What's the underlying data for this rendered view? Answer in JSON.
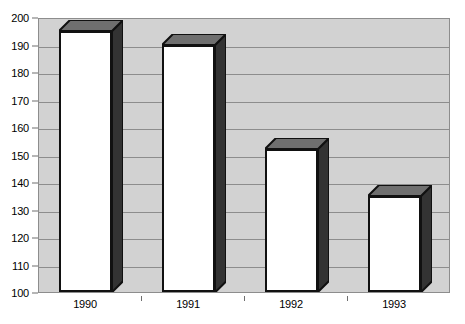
{
  "chart_data": {
    "type": "bar",
    "title": "",
    "subtitle": "",
    "xlabel": "",
    "ylabel": "",
    "categories": [
      "1990",
      "1991",
      "1992",
      "1993"
    ],
    "values": [
      195,
      190,
      152,
      135
    ],
    "series": [
      {
        "name": "",
        "values": [
          195,
          190,
          152,
          135
        ]
      }
    ],
    "ylim": [
      100,
      200
    ],
    "yticks": [
      100,
      110,
      120,
      130,
      140,
      150,
      160,
      170,
      180,
      190,
      200
    ],
    "ytick_labels": [
      "100",
      "110",
      "120",
      "130",
      "140",
      "150",
      "160",
      "170",
      "180",
      "190",
      "200"
    ],
    "grid": true,
    "legend": false,
    "legend_position": "none",
    "style": "3d-column",
    "colors": {
      "bar_front": "#ffffff",
      "bar_side": "#333333",
      "bar_top": "#6f6f6f",
      "bar_outline": "#111111",
      "plot_background": "#d2d2d2",
      "gridline": "#8d8d8d",
      "axis": "#6e6e6e",
      "text": "#000000",
      "page_background": "#ffffff"
    }
  },
  "axes": {
    "y_ticks": [
      {
        "label": "200",
        "value": 200
      },
      {
        "label": "190",
        "value": 190
      },
      {
        "label": "180",
        "value": 180
      },
      {
        "label": "170",
        "value": 170
      },
      {
        "label": "160",
        "value": 160
      },
      {
        "label": "150",
        "value": 150
      },
      {
        "label": "140",
        "value": 140
      },
      {
        "label": "130",
        "value": 130
      },
      {
        "label": "120",
        "value": 120
      },
      {
        "label": "110",
        "value": 110
      },
      {
        "label": "100",
        "value": 100
      }
    ],
    "x_ticks": [
      {
        "label": "1990"
      },
      {
        "label": "1991"
      },
      {
        "label": "1992"
      },
      {
        "label": "1993"
      }
    ]
  }
}
